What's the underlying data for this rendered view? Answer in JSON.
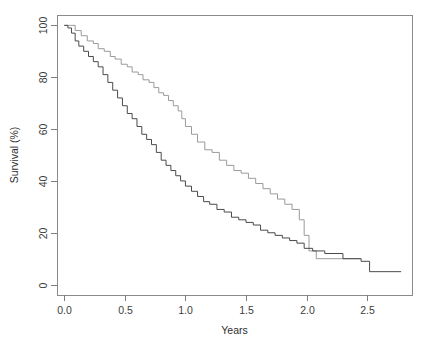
{
  "chart_data": {
    "type": "line",
    "title": "",
    "xlabel": "Years",
    "ylabel": "Survival (%)",
    "xlim": [
      -0.06,
      2.87
    ],
    "ylim": [
      -4,
      104
    ],
    "xticks": [
      0.0,
      0.5,
      1.0,
      1.5,
      2.0,
      2.5
    ],
    "xticklabels": [
      "0.0",
      "0.5",
      "1.0",
      "1.5",
      "2.0",
      "2.5"
    ],
    "yticks": [
      0,
      20,
      40,
      60,
      80,
      100
    ],
    "yticklabels": [
      "0",
      "20",
      "40",
      "60",
      "80",
      "100"
    ],
    "grid": false,
    "legend": "none",
    "step_shape": "post",
    "series": [
      {
        "name": "upper-curve",
        "color": "#9a9a9a",
        "x": [
          0.0,
          0.05,
          0.09,
          0.14,
          0.19,
          0.24,
          0.28,
          0.33,
          0.38,
          0.42,
          0.47,
          0.52,
          0.56,
          0.61,
          0.65,
          0.7,
          0.74,
          0.78,
          0.82,
          0.86,
          0.9,
          0.94,
          0.97,
          1.0,
          1.05,
          1.1,
          1.16,
          1.22,
          1.28,
          1.34,
          1.4,
          1.46,
          1.52,
          1.58,
          1.64,
          1.7,
          1.76,
          1.82,
          1.88,
          1.94,
          1.98,
          2.02,
          2.08,
          2.45
        ],
        "y": [
          100,
          100,
          98,
          96,
          94,
          93,
          91,
          90,
          88,
          87,
          85,
          84,
          82,
          81,
          79,
          78,
          76,
          74,
          73,
          71,
          69,
          67,
          64,
          61,
          58,
          55,
          52,
          51,
          48,
          46,
          44,
          43,
          41,
          39,
          37,
          35,
          33,
          31,
          29,
          25,
          19,
          13,
          10,
          10
        ]
      },
      {
        "name": "lower-curve",
        "color": "#4a4a4a",
        "x": [
          0.0,
          0.03,
          0.06,
          0.09,
          0.12,
          0.16,
          0.2,
          0.24,
          0.28,
          0.32,
          0.36,
          0.4,
          0.44,
          0.48,
          0.52,
          0.56,
          0.6,
          0.64,
          0.68,
          0.72,
          0.76,
          0.8,
          0.84,
          0.88,
          0.92,
          0.96,
          1.0,
          1.05,
          1.1,
          1.15,
          1.2,
          1.26,
          1.32,
          1.38,
          1.44,
          1.5,
          1.56,
          1.62,
          1.68,
          1.74,
          1.8,
          1.86,
          1.92,
          1.98,
          2.05,
          2.15,
          2.3,
          2.45,
          2.52,
          2.78
        ],
        "y": [
          100,
          99,
          97,
          94,
          92,
          90,
          88,
          86,
          84,
          81,
          78,
          75,
          72,
          69,
          66,
          64,
          61,
          58,
          56,
          54,
          51,
          48,
          46,
          44,
          42,
          40,
          38,
          36,
          34,
          32,
          31,
          29,
          28,
          26,
          25,
          24,
          23,
          21,
          20,
          19,
          18,
          17,
          16,
          14,
          13,
          12,
          10,
          9,
          5,
          5
        ]
      }
    ]
  },
  "geometry": {
    "plot_left": 57,
    "plot_right": 412,
    "plot_top": 15,
    "plot_bottom": 295
  }
}
